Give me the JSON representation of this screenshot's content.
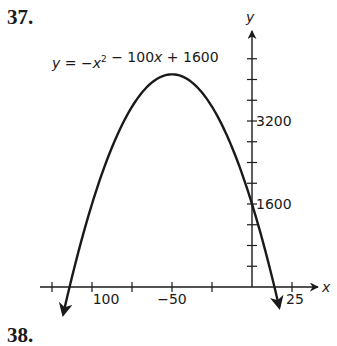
{
  "problem": {
    "number": "37.",
    "next_number": "38."
  },
  "chart_data": {
    "type": "line",
    "equation": {
      "a": -1,
      "b": -100,
      "c": 1600
    },
    "xlabel": "x",
    "ylabel": "y",
    "xlim": [
      -132,
      40
    ],
    "ylim": [
      -650,
      4900
    ],
    "x_ticks": [
      -125,
      -100,
      -75,
      -50,
      -25,
      25
    ],
    "x_tick_labels": [
      {
        "value": -100,
        "label": "100"
      },
      {
        "value": -50,
        "label": "−50"
      },
      {
        "value": 25,
        "label": "25"
      }
    ],
    "y_ticks": [
      400,
      800,
      1200,
      1600,
      2000,
      2400,
      2800,
      3200,
      3600,
      4000,
      4400
    ],
    "y_tick_labels": [
      {
        "value": 1600,
        "label": "1600"
      },
      {
        "value": 3200,
        "label": "3200"
      }
    ],
    "curve_domain": [
      -118,
      17
    ],
    "vertex": {
      "x": -50,
      "y": 4100
    },
    "x_intercepts": [
      -115.24,
      15.24
    ],
    "y_intercept": 1600,
    "grid": false,
    "legend": null,
    "arrows_on_curve_ends": true,
    "color": "#1a1a1a"
  }
}
